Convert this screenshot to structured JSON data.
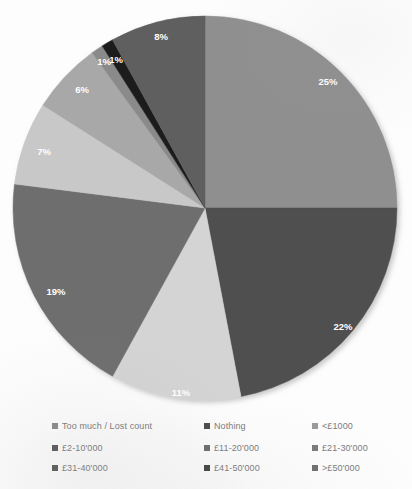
{
  "chart_data": {
    "type": "pie",
    "title": "",
    "labels": [
      "<£1000",
      "£2-10'000",
      "£11-20'000",
      "£21-30'000",
      "£31-40'000",
      "£41-50'000",
      ">£50'000",
      "Too much / Lost count",
      "Nothing"
    ],
    "values": [
      25,
      22,
      11,
      19,
      7,
      6,
      1,
      1,
      8
    ],
    "value_labels": [
      "25%",
      "22%",
      "11%",
      "19%",
      "7%",
      "6%",
      "1%",
      "1%",
      "8%"
    ],
    "colors": [
      "#8f8f8f",
      "#4f4f4f",
      "#d4d4d4",
      "#6e6e6e",
      "#c8c8c8",
      "#a8a8a8",
      "#8a8a8a",
      "#1f1f1f",
      "#5e5e5e"
    ],
    "legend_position": "bottom",
    "grid": false,
    "data_labels_shown": true,
    "start_angle_deg": 0,
    "direction": "clockwise"
  },
  "slices": [
    {
      "label_text": "25%",
      "color": "#8f8f8f",
      "start": 0,
      "end": 90,
      "lx": 328,
      "ly": 82
    },
    {
      "label_text": "22%",
      "color": "#4f4f4f",
      "start": 90,
      "end": 169.2,
      "lx": 343,
      "ly": 327
    },
    {
      "label_text": "11%",
      "color": "#d4d4d4",
      "start": 169.2,
      "end": 208.8,
      "lx": 181,
      "ly": 393
    },
    {
      "label_text": "19%",
      "color": "#6e6e6e",
      "start": 208.8,
      "end": 277.2,
      "lx": 56,
      "ly": 292
    },
    {
      "label_text": "7%",
      "color": "#c8c8c8",
      "start": 277.2,
      "end": 302.4,
      "lx": 44,
      "ly": 152
    },
    {
      "label_text": "6%",
      "color": "#a8a8a8",
      "start": 302.4,
      "end": 324,
      "lx": 82,
      "ly": 90
    },
    {
      "label_text": "1%",
      "color": "#8a8a8a",
      "start": 324,
      "end": 327.6,
      "lx": 116,
      "ly": 60
    },
    {
      "label_text": "1%",
      "color": "#1f1f1f",
      "start": 327.6,
      "end": 331.2,
      "lx": 104,
      "ly": 62
    },
    {
      "label_text": "8%",
      "color": "#5e5e5e",
      "start": 331.2,
      "end": 360,
      "lx": 161,
      "ly": 37
    }
  ],
  "legend": {
    "items": [
      {
        "label": "Too much / Lost count",
        "color": "#8a8a8a"
      },
      {
        "label": "Nothing",
        "color": "#4a4a4a"
      },
      {
        "label": "<£1000",
        "color": "#9a9a9a"
      },
      {
        "label": "£2-10'000",
        "color": "#5a5a5a"
      },
      {
        "label": "£11-20'000",
        "color": "#6a6a6a"
      },
      {
        "label": "£21-30'000",
        "color": "#7a7a7a"
      },
      {
        "label": "£31-40'000",
        "color": "#5a5a5a"
      },
      {
        "label": "£41-50'000",
        "color": "#3f3f3f"
      },
      {
        "label": ">£50'000",
        "color": "#6f6f6f"
      }
    ]
  }
}
